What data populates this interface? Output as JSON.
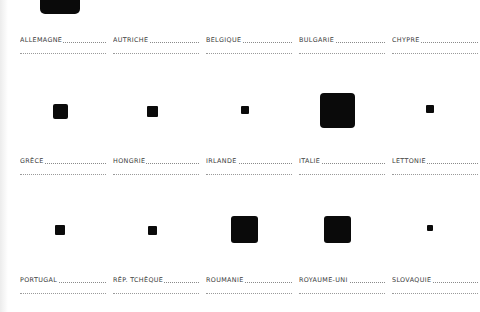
{
  "grid": {
    "columns_x": [
      20,
      113,
      206,
      299,
      392
    ],
    "rows_label_y": [
      36,
      157,
      276
    ]
  },
  "countries": [
    {
      "name": "ALLEMAGNE",
      "row": 0,
      "col": 0,
      "square": {
        "cx": 60,
        "cy": -6,
        "size": 40
      }
    },
    {
      "name": "AUTRICHE",
      "row": 0,
      "col": 1,
      "square": null
    },
    {
      "name": "BELGIQUE",
      "row": 0,
      "col": 2,
      "square": null
    },
    {
      "name": "BULGARIE",
      "row": 0,
      "col": 3,
      "square": null
    },
    {
      "name": "CHYPRE",
      "row": 0,
      "col": 4,
      "square": null
    },
    {
      "name": "GRÈCE",
      "row": 1,
      "col": 0,
      "square": {
        "cx": 60,
        "cy": 111,
        "size": 15
      }
    },
    {
      "name": "HONGRIE",
      "row": 1,
      "col": 1,
      "square": {
        "cx": 152,
        "cy": 111,
        "size": 11
      }
    },
    {
      "name": "IRLANDE",
      "row": 1,
      "col": 2,
      "square": {
        "cx": 245,
        "cy": 110,
        "size": 8
      }
    },
    {
      "name": "ITALIE",
      "row": 1,
      "col": 3,
      "square": {
        "cx": 337,
        "cy": 110,
        "size": 35
      }
    },
    {
      "name": "LETTONIE",
      "row": 1,
      "col": 4,
      "square": {
        "cx": 430,
        "cy": 109,
        "size": 8
      }
    },
    {
      "name": "PORTUGAL",
      "row": 2,
      "col": 0,
      "square": {
        "cx": 60,
        "cy": 230,
        "size": 10
      }
    },
    {
      "name": "RÉP. TCHÈQUE",
      "row": 2,
      "col": 1,
      "square": {
        "cx": 152,
        "cy": 230,
        "size": 9
      }
    },
    {
      "name": "ROUMANIE",
      "row": 2,
      "col": 2,
      "square": {
        "cx": 244,
        "cy": 229,
        "size": 27
      }
    },
    {
      "name": "ROYAUME-UNI",
      "row": 2,
      "col": 3,
      "square": {
        "cx": 337,
        "cy": 229,
        "size": 27
      }
    },
    {
      "name": "SLOVAQUIE",
      "row": 2,
      "col": 4,
      "square": {
        "cx": 430,
        "cy": 228,
        "size": 6
      }
    }
  ],
  "colors": {
    "square": "#0a0a0a",
    "label": "#3a3a3a",
    "dots": "#8a8a8a"
  }
}
